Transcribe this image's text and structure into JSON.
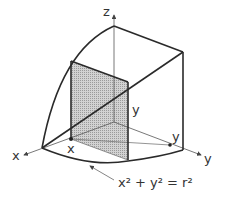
{
  "diagram": {
    "axes": {
      "z_label": "z",
      "x_label": "x",
      "y_label": "y"
    },
    "labels": {
      "point_x": "x",
      "point_y": "y",
      "height_y": "y"
    },
    "equation": {
      "text": "x² + y² = r²"
    },
    "colors": {
      "stroke": "#2a2a2a",
      "shade": "#bdbdbd"
    }
  }
}
